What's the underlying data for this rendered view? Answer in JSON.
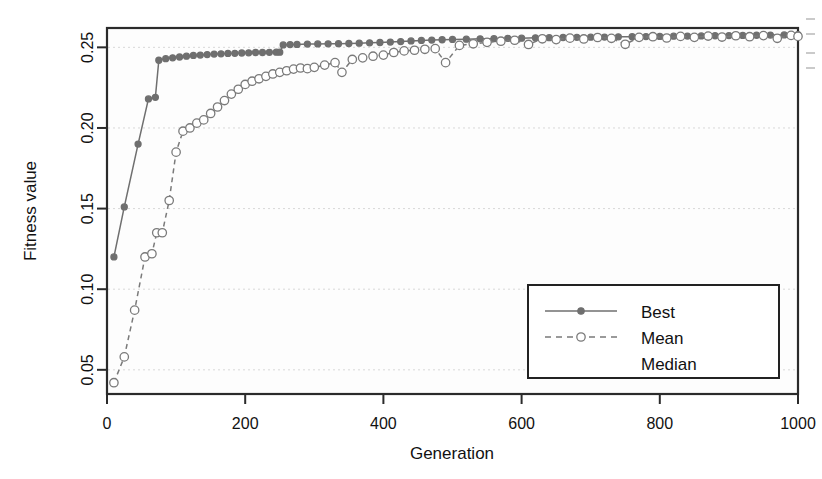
{
  "chart_data": {
    "type": "line",
    "title": "",
    "xlabel": "Generation",
    "ylabel": "Fitness value",
    "xlim": [
      0,
      1000
    ],
    "ylim": [
      0.035,
      0.262
    ],
    "xticks": [
      0,
      200,
      400,
      600,
      800,
      1000
    ],
    "xtick_labels": [
      "0",
      "200",
      "400",
      "600",
      "800",
      "1000"
    ],
    "yticks": [
      0.05,
      0.1,
      0.15,
      0.2,
      0.25
    ],
    "ytick_labels": [
      "0.05",
      "0.10",
      "0.15",
      "0.20",
      "0.25"
    ],
    "grid": true,
    "legend_position": "bottom-right",
    "series": [
      {
        "name": "Best",
        "style": "solid",
        "marker": "filled-circle",
        "color": "#6f6f6f",
        "x": [
          10,
          25,
          45,
          60,
          70,
          75,
          85,
          95,
          105,
          115,
          125,
          135,
          145,
          155,
          165,
          175,
          185,
          195,
          205,
          215,
          225,
          235,
          245,
          250,
          255,
          265,
          275,
          290,
          305,
          320,
          335,
          350,
          365,
          380,
          395,
          410,
          425,
          440,
          455,
          470,
          485,
          500,
          520,
          540,
          560,
          580,
          600,
          620,
          640,
          660,
          680,
          700,
          720,
          740,
          760,
          780,
          800,
          820,
          840,
          860,
          880,
          900,
          920,
          940,
          960,
          980,
          1000
        ],
        "y": [
          0.12,
          0.151,
          0.19,
          0.218,
          0.219,
          0.242,
          0.243,
          0.2435,
          0.244,
          0.2445,
          0.245,
          0.2452,
          0.2455,
          0.2458,
          0.246,
          0.2462,
          0.2463,
          0.2465,
          0.2466,
          0.2468,
          0.2468,
          0.2469,
          0.247,
          0.247,
          0.2515,
          0.2517,
          0.2518,
          0.252,
          0.2521,
          0.2522,
          0.2523,
          0.2524,
          0.2526,
          0.2528,
          0.253,
          0.2533,
          0.2536,
          0.254,
          0.2543,
          0.2545,
          0.2547,
          0.2549,
          0.2551,
          0.2553,
          0.2554,
          0.2556,
          0.2557,
          0.2559,
          0.256,
          0.2561,
          0.2562,
          0.2563,
          0.2564,
          0.2565,
          0.2566,
          0.2567,
          0.2568,
          0.2569,
          0.257,
          0.2571,
          0.2572,
          0.2573,
          0.2574,
          0.2575,
          0.2576,
          0.2577,
          0.2578
        ]
      },
      {
        "name": "Mean",
        "style": "dashed",
        "marker": "open-circle",
        "color": "#7a7a7a",
        "x": [
          10,
          25,
          40,
          55,
          65,
          72,
          80,
          90,
          100,
          110,
          120,
          130,
          140,
          150,
          160,
          170,
          180,
          190,
          200,
          210,
          220,
          230,
          240,
          250,
          260,
          270,
          280,
          290,
          300,
          315,
          330,
          340,
          355,
          370,
          385,
          400,
          415,
          430,
          445,
          460,
          475,
          490,
          510,
          530,
          550,
          570,
          590,
          610,
          630,
          650,
          670,
          690,
          710,
          730,
          750,
          770,
          790,
          810,
          830,
          850,
          870,
          890,
          910,
          930,
          950,
          970,
          990,
          1000
        ],
        "y": [
          0.042,
          0.058,
          0.087,
          0.12,
          0.122,
          0.135,
          0.135,
          0.155,
          0.185,
          0.198,
          0.2,
          0.203,
          0.205,
          0.209,
          0.213,
          0.217,
          0.221,
          0.224,
          0.227,
          0.229,
          0.2305,
          0.232,
          0.2335,
          0.2345,
          0.2355,
          0.2365,
          0.2372,
          0.2368,
          0.2376,
          0.239,
          0.2405,
          0.2345,
          0.2425,
          0.2435,
          0.2445,
          0.2452,
          0.2468,
          0.2478,
          0.2482,
          0.2488,
          0.2492,
          0.2405,
          0.2512,
          0.2522,
          0.2531,
          0.2538,
          0.2544,
          0.2518,
          0.2553,
          0.2548,
          0.2557,
          0.2552,
          0.2561,
          0.2556,
          0.2519,
          0.2562,
          0.2566,
          0.2558,
          0.2568,
          0.2562,
          0.257,
          0.2564,
          0.2572,
          0.2566,
          0.2573,
          0.2556,
          0.2574,
          0.2568
        ]
      },
      {
        "name": "Median",
        "style": "solid",
        "marker": "none",
        "color": "#8a8a8a",
        "x": [],
        "y": []
      }
    ]
  },
  "legend": {
    "entries": [
      {
        "label": "Best"
      },
      {
        "label": "Mean"
      },
      {
        "label": "Median"
      }
    ]
  }
}
